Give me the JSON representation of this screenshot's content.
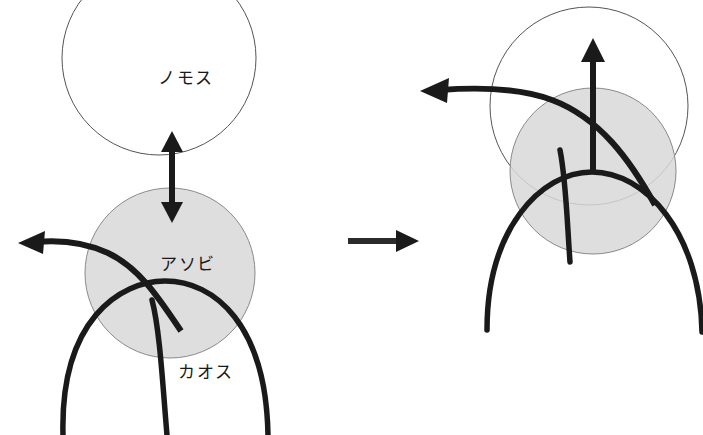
{
  "figure": {
    "width": 703,
    "height": 435,
    "background_color": "#ffffff",
    "stroke_color": "#1a1a1a",
    "thin_stroke_color": "#555555",
    "disc_fill_color": "#d8d8d8",
    "disc_stroke_color": "#8a8a8a"
  },
  "labels": {
    "nomos": "ノモス",
    "asobi": "アソビ",
    "chaos": "カオス"
  },
  "panels": [
    {
      "id": "left-panel",
      "name": "before-state",
      "nomos_circle": {
        "cx": 159,
        "cy": 58,
        "r": 97
      },
      "asobi_disc": {
        "cx": 170,
        "cy": 273,
        "r": 85
      },
      "label_positions": {
        "nomos": {
          "x": 158,
          "y": 84
        },
        "asobi": {
          "x": 160,
          "y": 270
        },
        "chaos": {
          "x": 178,
          "y": 378
        }
      },
      "double_arrow": {
        "x": 172,
        "y_top": 133,
        "y_bottom": 222
      },
      "escape_arrow_tip": {
        "x": 18,
        "y": 243
      }
    },
    {
      "id": "right-panel",
      "name": "after-state",
      "nomos_circle": {
        "cx": 589,
        "cy": 106,
        "r": 99
      },
      "asobi_disc": {
        "cx": 593,
        "cy": 171,
        "r": 83
      },
      "up_arrow": {
        "x": 593,
        "y_top": 40,
        "y_base": 170
      },
      "escape_arrow_tip": {
        "x": 420,
        "y": 91
      }
    }
  ],
  "transition_arrow": {
    "name": "transition-arrow",
    "x_start": 348,
    "x_end": 418,
    "y": 241
  }
}
